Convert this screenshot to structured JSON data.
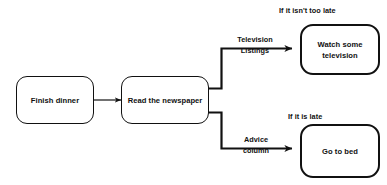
{
  "diagram": {
    "background_color": "#ffffff",
    "line_color": "#111111",
    "nodes": [
      {
        "id": "finish-dinner",
        "label": "Finish dinner"
      },
      {
        "id": "read-newspaper",
        "label": "Read the newspaper"
      },
      {
        "id": "watch-television",
        "label": "Watch some\ntelevision"
      },
      {
        "id": "go-to-bed",
        "label": "Go to bed"
      }
    ],
    "edge_labels": [
      {
        "id": "television-listings",
        "label": "Television\nListings"
      },
      {
        "id": "advice-column",
        "label": "Advice\ncolumn"
      }
    ],
    "captions": [
      {
        "id": "if-not-too-late",
        "label": "If it isn't too late"
      },
      {
        "id": "if-it-is-late",
        "label": "If it is late"
      }
    ]
  }
}
